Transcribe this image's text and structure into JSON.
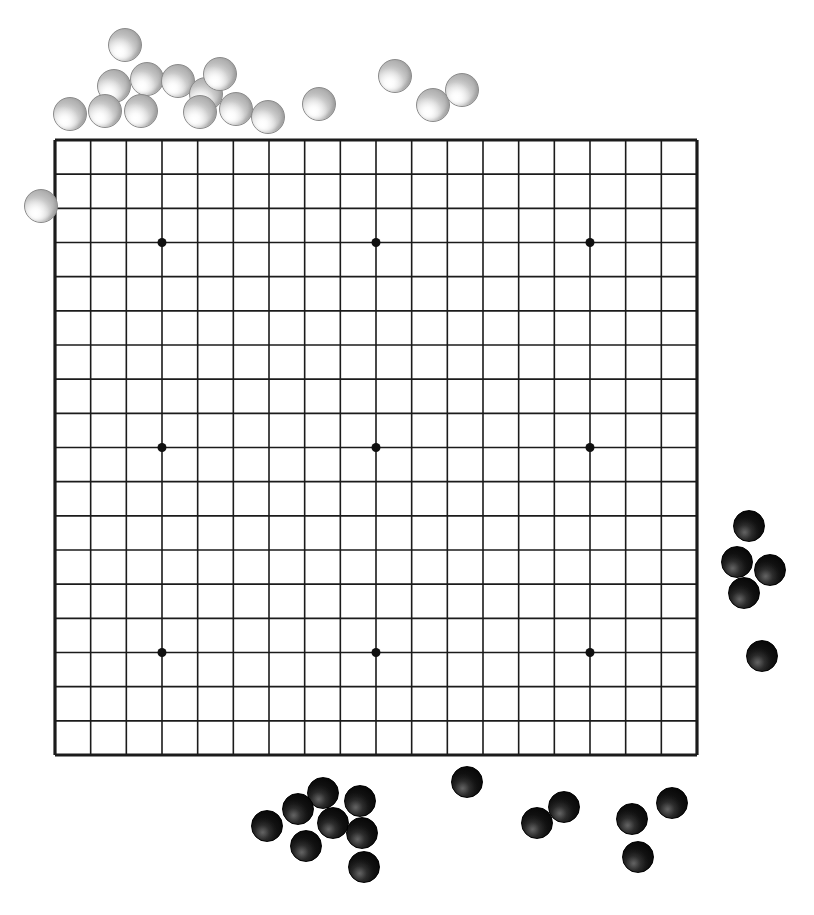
{
  "scene": {
    "title": "Go board with off-board stones",
    "width": 814,
    "height": 915,
    "background_color": "#ffffff"
  },
  "board": {
    "name": "go-board",
    "size": 19,
    "lines": 19,
    "cells": 18,
    "left": 55,
    "top": 140,
    "right": 697,
    "bottom": 755,
    "cell_width": 35.67,
    "cell_height": 34.17,
    "line_color": "#1b1b1b",
    "edge_line_width": 3.2,
    "inner_line_width": 1.6,
    "star_point_color": "#101010",
    "star_point_radius": 4.5,
    "star_points": [
      {
        "col": 3,
        "row": 3
      },
      {
        "col": 9,
        "row": 3
      },
      {
        "col": 15,
        "row": 3
      },
      {
        "col": 3,
        "row": 9
      },
      {
        "col": 9,
        "row": 9
      },
      {
        "col": 15,
        "row": 9
      },
      {
        "col": 3,
        "row": 15
      },
      {
        "col": 9,
        "row": 15
      },
      {
        "col": 15,
        "row": 15
      }
    ]
  },
  "stones": {
    "white_color": "#cfcfcf",
    "black_color": "#0a0a0a",
    "white_radius": 16,
    "black_radius": 14,
    "on_board_count": 0,
    "white_count": 17,
    "black_count": 18,
    "white": [
      {
        "label": "w1",
        "x": 124,
        "y": 44,
        "r": 16
      },
      {
        "label": "w2",
        "x": 146,
        "y": 78,
        "r": 16
      },
      {
        "label": "w3",
        "x": 113,
        "y": 85,
        "r": 16
      },
      {
        "label": "w4",
        "x": 177,
        "y": 80,
        "r": 16
      },
      {
        "label": "w5",
        "x": 205,
        "y": 93,
        "r": 16
      },
      {
        "label": "w6",
        "x": 219,
        "y": 73,
        "r": 16
      },
      {
        "label": "w7",
        "x": 69,
        "y": 113,
        "r": 16
      },
      {
        "label": "w8",
        "x": 104,
        "y": 110,
        "r": 16
      },
      {
        "label": "w9",
        "x": 140,
        "y": 110,
        "r": 16
      },
      {
        "label": "w10",
        "x": 199,
        "y": 111,
        "r": 16
      },
      {
        "label": "w11",
        "x": 235,
        "y": 108,
        "r": 16
      },
      {
        "label": "w12",
        "x": 267,
        "y": 116,
        "r": 16
      },
      {
        "label": "w13",
        "x": 318,
        "y": 103,
        "r": 16
      },
      {
        "label": "w14",
        "x": 394,
        "y": 75,
        "r": 16
      },
      {
        "label": "w15",
        "x": 432,
        "y": 104,
        "r": 16
      },
      {
        "label": "w16",
        "x": 461,
        "y": 89,
        "r": 16
      },
      {
        "label": "w17",
        "x": 40,
        "y": 205,
        "r": 16
      }
    ],
    "black": [
      {
        "label": "b1",
        "x": 748,
        "y": 525,
        "r": 15
      },
      {
        "label": "b2",
        "x": 736,
        "y": 561,
        "r": 15
      },
      {
        "label": "b3",
        "x": 769,
        "y": 569,
        "r": 15
      },
      {
        "label": "b4",
        "x": 743,
        "y": 592,
        "r": 15
      },
      {
        "label": "b5",
        "x": 761,
        "y": 655,
        "r": 15
      },
      {
        "label": "b6",
        "x": 466,
        "y": 781,
        "r": 15
      },
      {
        "label": "b7",
        "x": 322,
        "y": 792,
        "r": 15
      },
      {
        "label": "b8",
        "x": 359,
        "y": 800,
        "r": 15
      },
      {
        "label": "b9",
        "x": 297,
        "y": 808,
        "r": 15
      },
      {
        "label": "b10",
        "x": 332,
        "y": 822,
        "r": 15
      },
      {
        "label": "b11",
        "x": 266,
        "y": 825,
        "r": 15
      },
      {
        "label": "b12",
        "x": 361,
        "y": 832,
        "r": 15
      },
      {
        "label": "b13",
        "x": 305,
        "y": 845,
        "r": 15
      },
      {
        "label": "b14",
        "x": 363,
        "y": 866,
        "r": 15
      },
      {
        "label": "b15",
        "x": 536,
        "y": 822,
        "r": 15
      },
      {
        "label": "b16",
        "x": 563,
        "y": 806,
        "r": 15
      },
      {
        "label": "b17",
        "x": 631,
        "y": 818,
        "r": 15
      },
      {
        "label": "b18",
        "x": 671,
        "y": 802,
        "r": 15
      },
      {
        "label": "b19",
        "x": 637,
        "y": 856,
        "r": 15
      }
    ]
  }
}
